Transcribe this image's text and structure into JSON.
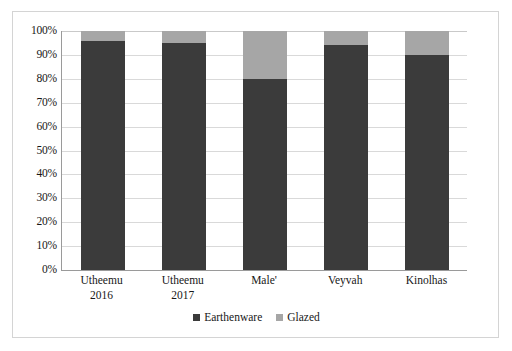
{
  "chart_data": {
    "type": "bar",
    "subtype": "stacked-100-percent",
    "title": "",
    "subtitle": "",
    "xlabel": "",
    "ylabel": "",
    "ylim": [
      0,
      100
    ],
    "y_tick_labels": [
      "100%",
      "90%",
      "80%",
      "70%",
      "60%",
      "50%",
      "40%",
      "30%",
      "20%",
      "10%",
      "0%"
    ],
    "y_tick_values": [
      100,
      90,
      80,
      70,
      60,
      50,
      40,
      30,
      20,
      10,
      0
    ],
    "grid": true,
    "legend_position": "bottom",
    "categories": [
      "Utheemu 2016",
      "Utheemu 2017",
      "Male'",
      "Veyvah",
      "Kinolhas"
    ],
    "category_lines": [
      [
        "Utheemu",
        "2016"
      ],
      [
        "Utheemu",
        "2017"
      ],
      [
        "Male'",
        ""
      ],
      [
        "Veyvah",
        ""
      ],
      [
        "Kinolhas",
        ""
      ]
    ],
    "series": [
      {
        "name": "Earthenware",
        "color": "#3b3b3b",
        "values": [
          96,
          95,
          80,
          94,
          90
        ]
      },
      {
        "name": "Glazed",
        "color": "#a6a6a6",
        "values": [
          4,
          5,
          20,
          6,
          10
        ]
      }
    ],
    "colors": {
      "earthenware": "#3b3b3b",
      "glazed": "#a6a6a6",
      "gridline": "#d9d9d9",
      "axis": "#9a9a9a",
      "border": "#d4d4d4",
      "background": "#ffffff"
    }
  }
}
